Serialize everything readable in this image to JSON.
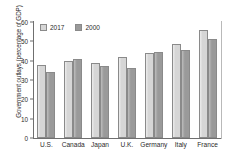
{
  "chart_data": {
    "type": "bar",
    "title": "",
    "subtitle": "",
    "xlabel": "",
    "ylabel": "Government outlays (percentage of GDP)",
    "ylim": [
      0,
      60
    ],
    "yticks": [
      0,
      10,
      20,
      30,
      40,
      50,
      60
    ],
    "ytick_labels": [
      "0",
      "10",
      "20",
      "30",
      "40",
      "50",
      "60"
    ],
    "grid": false,
    "legend_position": "top-left",
    "categories": [
      "U.S.",
      "Canada",
      "Japan",
      "U.K.",
      "Germany",
      "Italy",
      "France"
    ],
    "series": [
      {
        "name": "2017",
        "color": "#d6d6d6",
        "values": [
          38,
          40,
          39,
          42,
          44.2,
          48.8,
          56
        ]
      },
      {
        "name": "2000",
        "color": "#9a9a9a",
        "values": [
          34,
          40.7,
          37.5,
          36,
          44.5,
          45.5,
          51
        ]
      }
    ]
  },
  "legend": {
    "items": [
      {
        "label": "2017",
        "series": 0
      },
      {
        "label": "2000",
        "series": 1
      }
    ]
  },
  "colors": {
    "series_2017": "#d6d6d6",
    "series_2000": "#9a9a9a",
    "axis": "#6f6f6f",
    "text": "#2b2b2b",
    "background": "#ffffff"
  }
}
